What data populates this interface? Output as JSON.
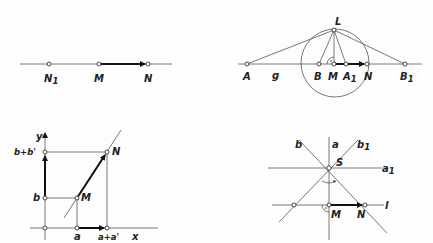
{
  "figures": {
    "fig1": {
      "labels": {
        "N1": "N",
        "N1_sub": "1",
        "M": "M",
        "N": "N"
      }
    },
    "fig2": {
      "labels": {
        "A": "A",
        "g": "g",
        "B": "B",
        "M": "M",
        "A1": "A",
        "A1_sub": "1",
        "N": "N",
        "B1": "B",
        "B1_sub": "1",
        "L": "L"
      }
    },
    "fig3": {
      "labels": {
        "y": "y",
        "x": "x",
        "b_plus_b_prime": "b+b'",
        "b": "b",
        "a": "a",
        "a_plus_a_prime": "a+a'",
        "M": "M",
        "N": "N"
      }
    },
    "fig4": {
      "labels": {
        "b": "b",
        "a": "a",
        "b1": "b",
        "b1_sub": "1",
        "S": "S",
        "a1": "a",
        "a1_sub": "1",
        "l": "l",
        "M": "M",
        "N": "N"
      }
    }
  }
}
